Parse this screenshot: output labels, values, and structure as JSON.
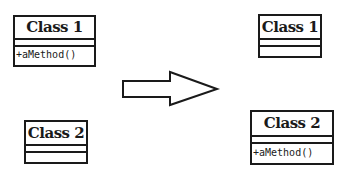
{
  "diagram": {
    "type": "uml-refactoring",
    "before": {
      "classes": [
        {
          "name": "Class 1",
          "attributes": [],
          "methods": [
            "+aMethod()"
          ]
        },
        {
          "name": "Class 2",
          "attributes": [],
          "methods": []
        }
      ]
    },
    "transition_arrow": {
      "direction": "right",
      "style": "hollow-block-arrow"
    },
    "after": {
      "classes": [
        {
          "name": "Class 1",
          "attributes": [],
          "methods": []
        },
        {
          "name": "Class 2",
          "attributes": [],
          "methods": [
            "+aMethod()"
          ]
        }
      ]
    },
    "colors": {
      "stroke": "#1a1a1a",
      "fill": "#ffffff"
    }
  }
}
